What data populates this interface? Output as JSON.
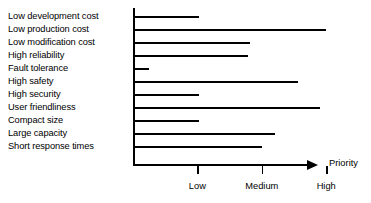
{
  "chart_data": {
    "type": "bar",
    "orientation": "horizontal",
    "title": "",
    "xlabel": "Priority",
    "ylabel": "",
    "grid": false,
    "legend": null,
    "xlim": [
      0,
      3.45
    ],
    "x_tick_values": [
      1,
      2,
      3
    ],
    "x_tick_labels": [
      "Low",
      "Medium",
      "High"
    ],
    "categories": [
      "Low development cost",
      "Low production cost",
      "Low modification cost",
      "High reliability",
      "Fault tolerance",
      "High safety",
      "High security",
      "User friendliness",
      "Compact size",
      "Large capacity",
      "Short response times"
    ],
    "values": [
      1.03,
      2.99,
      1.81,
      1.78,
      0.25,
      2.56,
      1.03,
      2.91,
      1.03,
      2.2,
      2.0
    ],
    "bar_color": "#000000",
    "axis_color": "#000000",
    "background_color": "#ffffff"
  },
  "axis": {
    "title": "Priority"
  }
}
